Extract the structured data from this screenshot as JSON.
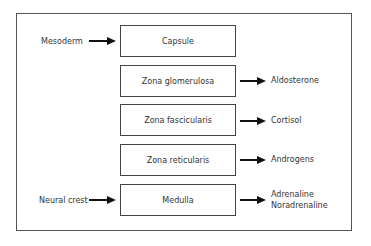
{
  "diagram": {
    "type": "flow",
    "zones": [
      {
        "label": "Capsule"
      },
      {
        "label": "Zona glomerulosa"
      },
      {
        "label": "Zona fascicularis"
      },
      {
        "label": "Zona reticularis"
      },
      {
        "label": "Medulla"
      }
    ],
    "origins": {
      "capsule": "Mesoderm",
      "medulla": "Neural crest"
    },
    "products": {
      "glomerulosa": "Aldosterone",
      "fascicularis": "Cortisol",
      "reticularis": "Androgens",
      "medulla_line1": "Adrenaline",
      "medulla_line2": "Noradrenaline"
    }
  }
}
